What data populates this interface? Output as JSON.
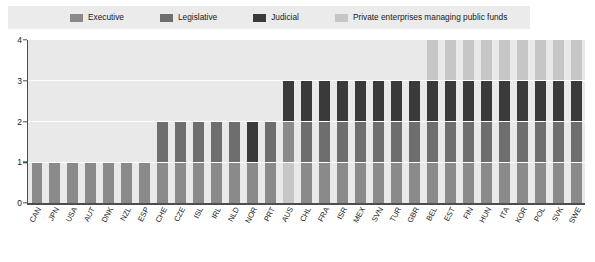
{
  "legend": {
    "items": [
      {
        "label": "Executive",
        "color": "#8a8a8a",
        "icon": "legend-swatch-icon"
      },
      {
        "label": "Legislative",
        "color": "#6e6e6e",
        "icon": "legend-swatch-icon"
      },
      {
        "label": "Judicial",
        "color": "#3a3a3a",
        "icon": "legend-swatch-icon"
      },
      {
        "label": "Private enterprises managing public funds",
        "color": "#c6c6c6",
        "icon": "legend-swatch-icon"
      }
    ]
  },
  "axis": {
    "y_ticks": [
      "0",
      "1",
      "2",
      "3",
      "4"
    ]
  },
  "chart_data": {
    "type": "bar",
    "title": "",
    "subtitle": "",
    "xlabel": "",
    "ylabel": "",
    "ylim": [
      0,
      4
    ],
    "grid": true,
    "stacked": true,
    "legend_position": "top",
    "categories": [
      "CAN",
      "JPN",
      "USA",
      "AUT",
      "DNK",
      "NZL",
      "ESP",
      "CHE",
      "CZE",
      "ISL",
      "IRL",
      "NLD",
      "NOR",
      "PRT",
      "AUS",
      "CHL",
      "FRA",
      "ISR",
      "MEX",
      "SVN",
      "TUR",
      "GBR",
      "BEL",
      "EST",
      "FIN",
      "HUN",
      "ITA",
      "KOR",
      "POL",
      "SVK",
      "SWE"
    ],
    "series": [
      {
        "name": "Executive",
        "color": "#8a8a8a",
        "values": [
          1,
          1,
          1,
          1,
          1,
          1,
          1,
          1,
          1,
          1,
          1,
          1,
          1,
          1,
          0,
          1,
          1,
          1,
          1,
          1,
          1,
          1,
          1,
          1,
          1,
          1,
          1,
          1,
          1,
          1,
          1
        ]
      },
      {
        "name": "Legislative",
        "color": "#6e6e6e",
        "values": [
          0,
          0,
          0,
          0,
          0,
          0,
          0,
          1,
          1,
          1,
          1,
          1,
          0,
          1,
          1,
          1,
          1,
          1,
          1,
          1,
          1,
          1,
          1,
          1,
          1,
          1,
          1,
          1,
          1,
          1,
          1
        ]
      },
      {
        "name": "Judicial",
        "color": "#3a3a3a",
        "values": [
          0,
          0,
          0,
          0,
          0,
          0,
          0,
          0,
          0,
          0,
          0,
          0,
          1,
          0,
          1,
          1,
          1,
          1,
          1,
          1,
          1,
          1,
          1,
          1,
          1,
          1,
          1,
          1,
          1,
          1,
          1
        ]
      },
      {
        "name": "Private enterprises managing public funds",
        "color": "#c6c6c6",
        "values": [
          0,
          0,
          0,
          0,
          0,
          0,
          0,
          0,
          0,
          0,
          0,
          0,
          0,
          0,
          1,
          0,
          0,
          0,
          0,
          0,
          0,
          0,
          1,
          1,
          1,
          1,
          1,
          1,
          1,
          1,
          1
        ]
      }
    ],
    "totals": [
      1,
      1,
      1,
      1,
      1,
      1,
      1,
      2,
      2,
      2,
      2,
      2,
      2,
      2,
      3,
      3,
      3,
      3,
      3,
      3,
      3,
      3,
      4,
      4,
      4,
      4,
      4,
      4,
      4,
      4,
      4
    ],
    "stack_order": [
      [
        "Executive"
      ],
      [
        "Executive"
      ],
      [
        "Executive"
      ],
      [
        "Executive"
      ],
      [
        "Executive"
      ],
      [
        "Executive"
      ],
      [
        "Executive"
      ],
      [
        "Executive",
        "Legislative"
      ],
      [
        "Executive",
        "Legislative"
      ],
      [
        "Executive",
        "Legislative"
      ],
      [
        "Executive",
        "Legislative"
      ],
      [
        "Executive",
        "Legislative"
      ],
      [
        "Executive",
        "Judicial"
      ],
      [
        "Executive",
        "Legislative"
      ],
      [
        "Private enterprises managing public funds",
        "Executive",
        "Judicial"
      ],
      [
        "Executive",
        "Legislative",
        "Judicial"
      ],
      [
        "Executive",
        "Legislative",
        "Judicial"
      ],
      [
        "Executive",
        "Legislative",
        "Judicial"
      ],
      [
        "Executive",
        "Legislative",
        "Judicial"
      ],
      [
        "Executive",
        "Legislative",
        "Judicial"
      ],
      [
        "Executive",
        "Legislative",
        "Judicial"
      ],
      [
        "Executive",
        "Legislative",
        "Judicial"
      ],
      [
        "Executive",
        "Legislative",
        "Judicial",
        "Private enterprises managing public funds"
      ],
      [
        "Executive",
        "Legislative",
        "Judicial",
        "Private enterprises managing public funds"
      ],
      [
        "Executive",
        "Legislative",
        "Judicial",
        "Private enterprises managing public funds"
      ],
      [
        "Executive",
        "Legislative",
        "Judicial",
        "Private enterprises managing public funds"
      ],
      [
        "Executive",
        "Legislative",
        "Judicial",
        "Private enterprises managing public funds"
      ],
      [
        "Executive",
        "Legislative",
        "Judicial",
        "Private enterprises managing public funds"
      ],
      [
        "Executive",
        "Legislative",
        "Judicial",
        "Private enterprises managing public funds"
      ],
      [
        "Executive",
        "Legislative",
        "Judicial",
        "Private enterprises managing public funds"
      ],
      [
        "Executive",
        "Legislative",
        "Judicial",
        "Private enterprises managing public funds"
      ]
    ]
  }
}
